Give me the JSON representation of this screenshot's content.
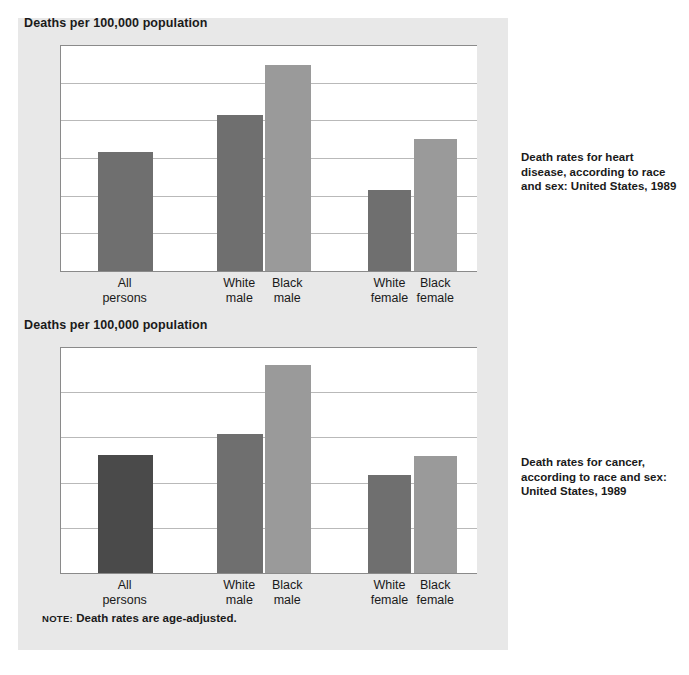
{
  "note": {
    "label": "NOTE:",
    "text": "Death rates are age-adjusted."
  },
  "captions": {
    "heart": "Death rates for heart disease, according to race and sex: United States, 1989",
    "cancer": "Death rates for cancer, according to race and sex: United States, 1989"
  },
  "colors": {
    "panel_background": "#e8e8e8",
    "plot_background": "#ffffff",
    "gridline": "#b9b9b9",
    "axis": "#8a8a8a",
    "bar_dark": "#6f6f6f",
    "bar_light": "#9a9a9a",
    "bar_darkest": "#4a4a4a",
    "text": "#1a1a1a"
  },
  "chart_data": [
    {
      "id": "heart",
      "type": "bar",
      "title": "Deaths per 100,000 population",
      "subtitle": "Death rates for heart disease, according to race and sex: United States, 1989",
      "xlabel": "",
      "ylabel": "Deaths per 100,000 population",
      "ylim": [
        0,
        300
      ],
      "yticks": [
        0,
        50,
        100,
        150,
        200,
        250,
        300
      ],
      "ytick_labels": [
        "0",
        "50",
        "100",
        "150",
        "200",
        "250",
        "300"
      ],
      "grid": true,
      "legend": "none",
      "categories": [
        "All persons",
        "White male",
        "Black male",
        "White female",
        "Black female"
      ],
      "category_lines": [
        [
          "All",
          "persons"
        ],
        [
          "White",
          "male"
        ],
        [
          "Black",
          "male"
        ],
        [
          "White",
          "female"
        ],
        [
          "Black",
          "female"
        ]
      ],
      "values": [
        158,
        207,
        273,
        107,
        175
      ],
      "bar_colors": [
        "#6f6f6f",
        "#6f6f6f",
        "#9a9a9a",
        "#6f6f6f",
        "#9a9a9a"
      ]
    },
    {
      "id": "cancer",
      "type": "bar",
      "title": "Deaths per 100,000 population",
      "subtitle": "Death rates for cancer, according to race and sex: United States, 1989",
      "xlabel": "",
      "ylabel": "Deaths per 100,000 population",
      "ylim": [
        0,
        250
      ],
      "yticks": [
        0,
        50,
        100,
        150,
        200,
        250
      ],
      "ytick_labels": [
        "0",
        "50",
        "100",
        "150",
        "200",
        "250"
      ],
      "grid": true,
      "legend": "none",
      "categories": [
        "All persons",
        "White male",
        "Black male",
        "White female",
        "Black female"
      ],
      "category_lines": [
        [
          "All",
          "persons"
        ],
        [
          "White",
          "male"
        ],
        [
          "Black",
          "male"
        ],
        [
          "White",
          "female"
        ],
        [
          "Black",
          "female"
        ]
      ],
      "values": [
        130,
        154,
        230,
        108,
        129
      ],
      "bar_colors": [
        "#4a4a4a",
        "#6f6f6f",
        "#9a9a9a",
        "#6f6f6f",
        "#9a9a9a"
      ]
    }
  ],
  "layout": {
    "bar_slots": [
      {
        "center_pct": 15.5,
        "width_pct": 13.0
      },
      {
        "center_pct": 43.0,
        "width_pct": 11.0
      },
      {
        "center_pct": 54.5,
        "width_pct": 11.0
      },
      {
        "center_pct": 79.0,
        "width_pct": 10.5
      },
      {
        "center_pct": 90.0,
        "width_pct": 10.5
      }
    ]
  }
}
